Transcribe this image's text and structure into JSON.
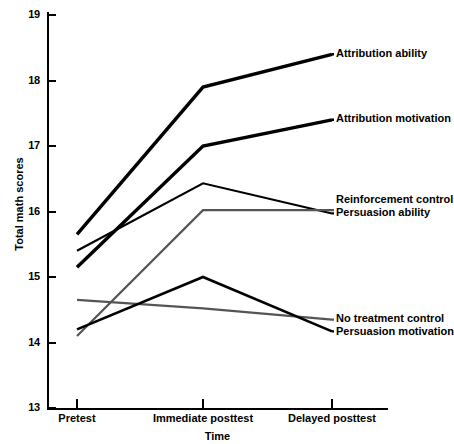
{
  "chart_data": {
    "type": "line",
    "title": "",
    "xlabel": "Time",
    "ylabel": "Total math scores",
    "categories": [
      "Pretest",
      "Immediate posttest",
      "Delayed posttest"
    ],
    "ylim": [
      13,
      19
    ],
    "yticks": [
      "13",
      "14",
      "15",
      "16",
      "17",
      "18",
      "19"
    ],
    "grid": false,
    "legend_position": "right-inline",
    "series": [
      {
        "name": "Attribution ability",
        "values": [
          15.65,
          17.9,
          18.4
        ],
        "color": "#000000",
        "width": 3.4,
        "label": "Attribution ability"
      },
      {
        "name": "Attribution motivation",
        "values": [
          15.15,
          17.0,
          17.4
        ],
        "color": "#000000",
        "width": 3.4,
        "label": "Attribution motivation"
      },
      {
        "name": "Reinforcement control",
        "values": [
          15.4,
          16.43,
          15.97
        ],
        "color": "#000000",
        "width": 2.2,
        "label": "Reinforcement control"
      },
      {
        "name": "Persuasion ability",
        "values": [
          14.1,
          16.02,
          16.02
        ],
        "color": "#555555",
        "width": 2.2,
        "label": "Persuasion ability"
      },
      {
        "name": "No treatment control",
        "values": [
          14.65,
          14.52,
          14.35
        ],
        "color": "#555555",
        "width": 2.2,
        "label": "No treatment control"
      },
      {
        "name": "Persuasion motivation",
        "values": [
          14.2,
          15.0,
          14.17
        ],
        "color": "#000000",
        "width": 2.6,
        "label": "Persuasion motivation"
      }
    ],
    "annotations": [
      {
        "text": "Attribution ability",
        "x": 336,
        "y": 47
      },
      {
        "text": "Attribution motivation",
        "x": 336,
        "y": 112
      },
      {
        "text": "Reinforcement control",
        "x": 336,
        "y": 193
      },
      {
        "text": "Persuasion ability",
        "x": 336,
        "y": 206
      },
      {
        "text": "No treatment control",
        "x": 336,
        "y": 312
      },
      {
        "text": "Persuasion motivation",
        "x": 336,
        "y": 325
      }
    ]
  }
}
